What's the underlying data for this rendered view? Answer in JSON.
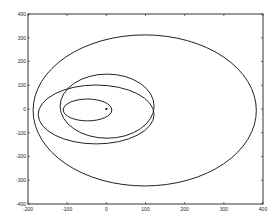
{
  "chart_data": {
    "type": "line",
    "title": "",
    "xlabel": "",
    "ylabel": "",
    "xlim": [
      -200,
      400
    ],
    "ylim": [
      -400,
      400
    ],
    "xticks": [
      -200,
      -100,
      0,
      100,
      200,
      300,
      400
    ],
    "yticks": [
      -400,
      -300,
      -200,
      -100,
      0,
      100,
      200,
      300,
      400
    ],
    "xtick_labels": [
      "-200",
      "-100",
      "0",
      "100",
      "200",
      "300",
      "400"
    ],
    "ytick_labels": [
      "-400",
      "-300",
      "-200",
      "-100",
      "0",
      "100",
      "200",
      "300",
      "400"
    ],
    "grid": false,
    "legend": null,
    "series": [
      {
        "name": "small-orbit",
        "shape": "ellipse",
        "cx": -48,
        "cy": -4,
        "rx": 62,
        "ry": 46
      },
      {
        "name": "medium-orbit-upper",
        "shape": "ellipse",
        "cx": 2,
        "cy": 12,
        "rx": 120,
        "ry": 135
      },
      {
        "name": "medium-orbit-lower",
        "shape": "ellipse",
        "cx": -26,
        "cy": -23,
        "rx": 148,
        "ry": 124
      },
      {
        "name": "large-orbit",
        "shape": "ellipse",
        "cx": 98,
        "cy": -6,
        "rx": 285,
        "ry": 318
      }
    ],
    "markers": [
      {
        "name": "center-star",
        "x": 0,
        "y": 0,
        "symbol": "*"
      }
    ],
    "colors": {
      "line": "#222222",
      "axis": "#333333",
      "background": "#ffffff"
    }
  }
}
